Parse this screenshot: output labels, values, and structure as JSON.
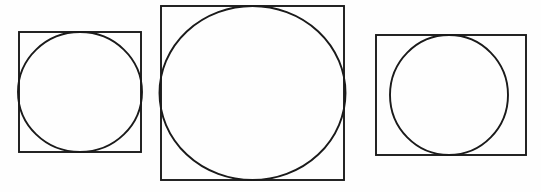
{
  "figure": {
    "canvas": {
      "width": 541,
      "height": 192,
      "background_color": "#fefefe"
    },
    "style": {
      "stroke_color": "#1a1a1a",
      "stroke_width": 1.9,
      "fill": "none"
    },
    "shapes": [
      {
        "id": "figure-1",
        "label": "small square with inscribed circle",
        "rect": {
          "x": 19,
          "y": 32,
          "width": 122,
          "height": 120
        },
        "circle": {
          "cx": 80,
          "cy": 92,
          "rx": 62,
          "ry": 60
        }
      },
      {
        "id": "figure-2",
        "label": "large square with inscribed circle",
        "rect": {
          "x": 161,
          "y": 6,
          "width": 183,
          "height": 174
        },
        "circle": {
          "cx": 252.5,
          "cy": 93,
          "rx": 93,
          "ry": 87
        }
      },
      {
        "id": "figure-3",
        "label": "wide rectangle with inscribed circle",
        "rect": {
          "x": 376,
          "y": 35,
          "width": 150,
          "height": 120
        },
        "circle": {
          "cx": 449,
          "cy": 95,
          "rx": 59,
          "ry": 60
        }
      }
    ]
  }
}
